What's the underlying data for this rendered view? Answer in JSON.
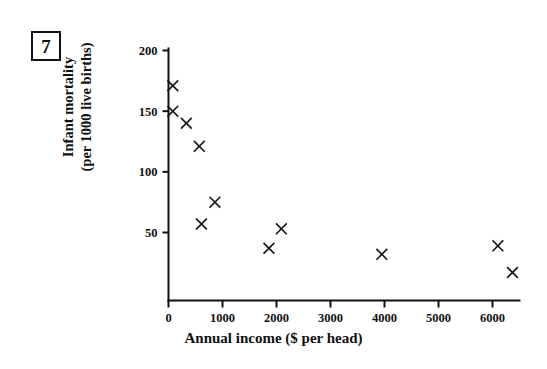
{
  "question_number": "7",
  "chart_data": {
    "type": "scatter",
    "title": "",
    "xlabel": "Annual income ($ per head)",
    "ylabel": "Infant mortality (per 1000 live births)",
    "ylabel_line1": "Infant mortality",
    "ylabel_line2": "(per 1000 live births)",
    "xlim": [
      0,
      6500
    ],
    "ylim": [
      0,
      200
    ],
    "xticks": [
      0,
      1000,
      2000,
      3000,
      4000,
      5000,
      6000
    ],
    "xtick_labels": [
      "0",
      "1000",
      "2000",
      "3000",
      "4000",
      "5000",
      "6000"
    ],
    "yticks": [
      50,
      100,
      150,
      200
    ],
    "ytick_labels": [
      "50",
      "100",
      "150",
      "200"
    ],
    "grid": false,
    "legend": null,
    "marker": "x",
    "marker_color": "#1a1a1a",
    "points": [
      {
        "x": 80,
        "y": 171
      },
      {
        "x": 80,
        "y": 150
      },
      {
        "x": 330,
        "y": 140
      },
      {
        "x": 570,
        "y": 121
      },
      {
        "x": 610,
        "y": 57
      },
      {
        "x": 860,
        "y": 75
      },
      {
        "x": 1860,
        "y": 37
      },
      {
        "x": 2090,
        "y": 53
      },
      {
        "x": 3950,
        "y": 32
      },
      {
        "x": 6100,
        "y": 39
      },
      {
        "x": 6370,
        "y": 17
      }
    ]
  }
}
